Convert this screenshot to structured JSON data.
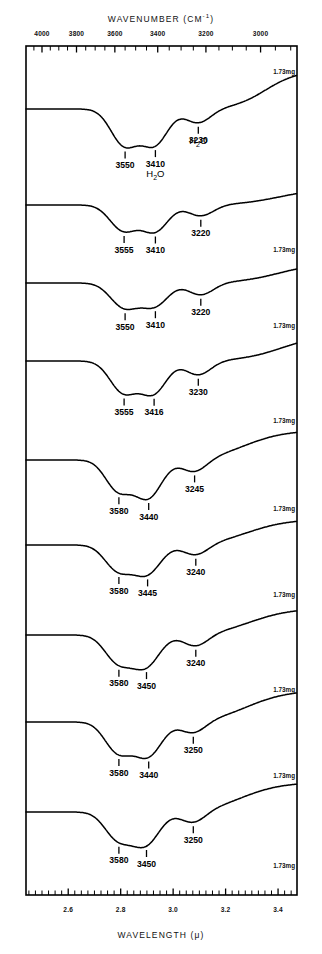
{
  "figure": {
    "top_axis": {
      "title": "WAVENUMBER  (CM",
      "title_sup": "-1",
      "title_close": ")",
      "unit": "CM-1",
      "ticks": [
        4000,
        3800,
        3600,
        3400,
        3200,
        3000
      ]
    },
    "bottom_axis": {
      "title": "WAVELENGTH  (μ)",
      "unit": "μ",
      "ticks": [
        "2.6",
        "2.8",
        "3.0",
        "3.2",
        "3.4"
      ]
    },
    "plot_frame": {
      "left": 26,
      "right": 297,
      "top": 46,
      "bottom": 895
    },
    "line_color": "#000000"
  },
  "chart_data": {
    "type": "line",
    "title": "",
    "xlabel": "WAVELENGTH (μ)",
    "ylabel": "",
    "xlabel_secondary": "WAVENUMBER (CM-1)",
    "xlim_wavenumber": [
      4100,
      2880
    ],
    "xlim_wavelength": [
      2.44,
      3.47
    ],
    "grid": false,
    "legend": "none",
    "series": [
      {
        "name": "spectrum-1",
        "mass_label": "1.73mg",
        "peaks": [
          3550,
          3410,
          3230
        ],
        "peak_labels": [
          "3550",
          "3410",
          "3230"
        ],
        "annotations": [
          {
            "text": "H2O",
            "at": 3410
          },
          {
            "text": "H2O",
            "at": 3230
          }
        ]
      },
      {
        "name": "spectrum-2",
        "mass_label": "1.73mg",
        "peaks": [
          3555,
          3410,
          3220
        ],
        "peak_labels": [
          "3555",
          "3410",
          "3220"
        ],
        "annotations": []
      },
      {
        "name": "spectrum-3",
        "mass_label": "1.73mg",
        "peaks": [
          3550,
          3410,
          3220
        ],
        "peak_labels": [
          "3550",
          "3410",
          "3220"
        ],
        "annotations": []
      },
      {
        "name": "spectrum-4",
        "mass_label": "1.73mg",
        "peaks": [
          3555,
          3416,
          3230
        ],
        "peak_labels": [
          "3555",
          "3416",
          "3230"
        ],
        "annotations": []
      },
      {
        "name": "spectrum-5",
        "mass_label": "1.73mg",
        "peaks": [
          3580,
          3440,
          3245
        ],
        "peak_labels": [
          "3580",
          "3440",
          "3245"
        ],
        "annotations": []
      },
      {
        "name": "spectrum-6",
        "mass_label": "1.73mg",
        "peaks": [
          3580,
          3445,
          3240
        ],
        "peak_labels": [
          "3580",
          "3445",
          "3240"
        ],
        "annotations": []
      },
      {
        "name": "spectrum-7",
        "mass_label": "1.73mg",
        "peaks": [
          3580,
          3450,
          3240
        ],
        "peak_labels": [
          "3580",
          "3450",
          "3240"
        ],
        "annotations": []
      },
      {
        "name": "spectrum-8",
        "mass_label": "1.73mg",
        "peaks": [
          3580,
          3440,
          3250
        ],
        "peak_labels": [
          "3580",
          "3440",
          "3250"
        ],
        "annotations": []
      },
      {
        "name": "spectrum-9",
        "mass_label": "1.73mg",
        "peaks": [
          3580,
          3450,
          3250
        ],
        "peak_labels": [
          "3580",
          "3450",
          "3250"
        ],
        "annotations": []
      }
    ]
  },
  "labels": {
    "top_ticks": [
      "4000",
      "3800",
      "3600",
      "3400",
      "3200",
      "3000"
    ],
    "bottom_ticks": [
      "2.6",
      "2.8",
      "3.0",
      "3.2",
      "3.4"
    ],
    "mass": "1.73mg",
    "water": "H₂O",
    "top_title": "WAVENUMBER  (CM",
    "bottom_title": "WAVELENGTH  (μ)"
  }
}
